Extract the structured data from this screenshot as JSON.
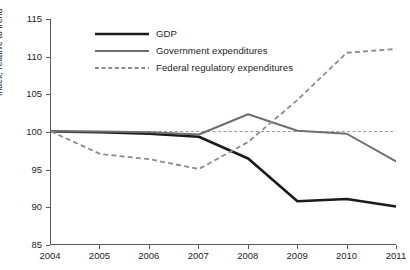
{
  "chart_data": {
    "type": "line",
    "title": "",
    "xlabel": "",
    "ylabel": "Index, relative to trend",
    "x": [
      2004,
      2005,
      2006,
      2007,
      2008,
      2009,
      2010,
      2011
    ],
    "xticklabels": [
      "2004",
      "2005",
      "2006",
      "2007",
      "2008",
      "2009",
      "2010",
      "2011"
    ],
    "yticklabels": [
      "85",
      "90",
      "95",
      "100",
      "105",
      "110",
      "115"
    ],
    "ylim": [
      85,
      115
    ],
    "xlim": [
      2004,
      2011
    ],
    "ytick_step": 5,
    "grid": false,
    "legend_position": "top-center",
    "reference_line": {
      "value": 100,
      "style": "dashed",
      "color": "#9a9a9a",
      "label": ""
    },
    "series": [
      {
        "name": "GDP",
        "color": "#1a1a1a",
        "style": "solid",
        "width": 2.6,
        "values": [
          100.0,
          99.9,
          99.7,
          99.3,
          96.4,
          90.7,
          91.0,
          90.0
        ]
      },
      {
        "name": "Government expenditures",
        "color": "#6d6e71",
        "style": "solid",
        "width": 2.0,
        "values": [
          100.0,
          100.0,
          99.9,
          99.6,
          102.3,
          100.1,
          99.7,
          96.0
        ]
      },
      {
        "name": "Federal regulatory expenditures",
        "color": "#8b8b8b",
        "style": "dashed",
        "width": 1.8,
        "values": [
          100.0,
          97.0,
          96.3,
          95.0,
          98.6,
          104.2,
          110.5,
          111.0
        ]
      }
    ]
  },
  "legend": {
    "items": [
      {
        "label": "GDP"
      },
      {
        "label": "Government expenditures"
      },
      {
        "label": "Federal regulatory expenditures"
      }
    ]
  },
  "axes": {
    "y_title": "Index, relative to trend"
  }
}
